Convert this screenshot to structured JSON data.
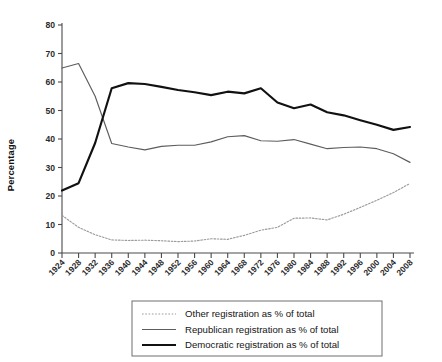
{
  "chart_data": {
    "type": "line",
    "title": "",
    "xlabel": "",
    "ylabel": "Percentage",
    "xlim": [
      1924,
      2008
    ],
    "ylim": [
      0,
      80
    ],
    "ytick_step": 10,
    "grid": false,
    "legend_position": "below-center",
    "x": [
      1924,
      1928,
      1932,
      1936,
      1940,
      1944,
      1948,
      1952,
      1956,
      1960,
      1964,
      1968,
      1972,
      1976,
      1980,
      1984,
      1988,
      1992,
      1996,
      2000,
      2004,
      2008
    ],
    "xticklabels": [
      "1924",
      "1928",
      "1932",
      "1936",
      "1940",
      "1944",
      "1948",
      "1952",
      "1956",
      "1960",
      "1964",
      "1968",
      "1972",
      "1976",
      "1980",
      "1984",
      "1988",
      "1992",
      "1996",
      "2000",
      "2004",
      "2008"
    ],
    "yticklabels": [
      "0",
      "10",
      "20",
      "30",
      "40",
      "50",
      "60",
      "70",
      "80"
    ],
    "yticks": [
      0,
      10,
      20,
      30,
      40,
      50,
      60,
      70,
      80
    ],
    "series": [
      {
        "name": "Other registration as % of total",
        "key": "other",
        "style": "dotted",
        "color": "#9b9b9b",
        "values": [
          13.2,
          9.0,
          6.4,
          4.6,
          4.4,
          4.5,
          4.3,
          4.0,
          4.2,
          5.0,
          4.8,
          6.2,
          8.0,
          9.0,
          12.2,
          12.3,
          11.6,
          13.6,
          16.0,
          18.5,
          21.2,
          24.4
        ]
      },
      {
        "name": "Republican registration as % of total",
        "key": "republican",
        "style": "solid-thin",
        "color": "#5d5d5d",
        "values": [
          64.9,
          66.5,
          55.0,
          38.4,
          37.2,
          36.2,
          37.4,
          37.8,
          37.8,
          39.0,
          40.8,
          41.2,
          39.4,
          39.2,
          39.8,
          38.2,
          36.6,
          37.0,
          37.2,
          36.6,
          34.8,
          31.8
        ]
      },
      {
        "name": "Democratic registration as % of total",
        "key": "democratic",
        "style": "solid-thick",
        "color": "#111111",
        "values": [
          21.9,
          24.5,
          38.6,
          57.8,
          59.6,
          59.3,
          58.3,
          57.2,
          56.4,
          55.4,
          56.6,
          56.0,
          57.8,
          52.8,
          50.8,
          52.1,
          49.4,
          48.3,
          46.6,
          45.0,
          43.2,
          44.2
        ]
      }
    ],
    "legend_entries": [
      {
        "label": "Other registration as % of total",
        "style": "dotted",
        "color": "#9b9b9b"
      },
      {
        "label": "Republican registration as % of total",
        "style": "solid-thin",
        "color": "#5d5d5d"
      },
      {
        "label": "Democratic registration as % of total",
        "style": "solid-thick",
        "color": "#111111"
      }
    ]
  }
}
